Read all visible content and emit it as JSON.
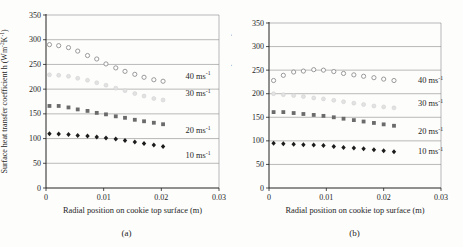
{
  "chart_data": [
    {
      "type": "scatter",
      "caption": "(a)",
      "xlabel": "Radial position on cookie top surface (m)",
      "ylabel_parts": [
        {
          "t": "Surface heat transfer coefficient h (Wm"
        },
        {
          "sup": "-2"
        },
        {
          "t": "K"
        },
        {
          "sup": "-1"
        },
        {
          "t": ")"
        }
      ],
      "xlim": [
        0,
        0.03
      ],
      "ylim": [
        0,
        350
      ],
      "grid": "horizontal",
      "legend_position": "inline-right",
      "xticks": [
        {
          "v": 0,
          "label": "0"
        },
        {
          "v": 0.01,
          "label": "0.01"
        },
        {
          "v": 0.02,
          "label": "0.02"
        },
        {
          "v": 0.03,
          "label": "0.03"
        }
      ],
      "yticks": [
        {
          "v": 0,
          "label": "0"
        },
        {
          "v": 50,
          "label": "50"
        },
        {
          "v": 100,
          "label": "100"
        },
        {
          "v": 150,
          "label": "150"
        },
        {
          "v": 200,
          "label": "200"
        },
        {
          "v": 250,
          "label": "250"
        },
        {
          "v": 300,
          "label": "300"
        },
        {
          "v": 350,
          "label": "350"
        }
      ],
      "x": [
        0.0006,
        0.0022,
        0.0039,
        0.0055,
        0.0072,
        0.0088,
        0.0104,
        0.0121,
        0.0137,
        0.0154,
        0.017,
        0.0187,
        0.0203
      ],
      "series": [
        {
          "name_parts": [
            {
              "t": "40 ms"
            },
            {
              "sup": "-1"
            }
          ],
          "marker": "open-circle",
          "color": "#8f8f8f",
          "label_x": 0.0242,
          "label_y": 227,
          "values": [
            290,
            288,
            284,
            277,
            268,
            261,
            251,
            243,
            236,
            230,
            224,
            219,
            216
          ]
        },
        {
          "name_parts": [
            {
              "t": "30 ms"
            },
            {
              "sup": "-1"
            }
          ],
          "marker": "light-circle",
          "color": "#e2e2e2",
          "label_x": 0.0242,
          "label_y": 191,
          "values": [
            229,
            228,
            226,
            222,
            218,
            213,
            208,
            202,
            197,
            191,
            186,
            181,
            178
          ]
        },
        {
          "name_parts": [
            {
              "t": "20 ms"
            },
            {
              "sup": "-1"
            }
          ],
          "marker": "square",
          "color": "#6b6b6b",
          "label_x": 0.0242,
          "label_y": 116,
          "values": [
            166,
            166,
            163,
            159,
            156,
            152,
            149,
            145,
            142,
            138,
            135,
            132,
            129
          ]
        },
        {
          "name_parts": [
            {
              "t": "10 ms"
            },
            {
              "sup": "-1"
            }
          ],
          "marker": "diamond",
          "color": "#1c1c1c",
          "label_x": 0.0242,
          "label_y": 66,
          "values": [
            110,
            109,
            108,
            106,
            105,
            103,
            101,
            99,
            96,
            93,
            90,
            87,
            84
          ]
        }
      ]
    },
    {
      "type": "scatter",
      "caption": "(b)",
      "xlabel": "Radial position on cookie top surface (m)",
      "ylabel_parts": [
        {
          "t": "Surface heat transfer coefficient h (Wm"
        },
        {
          "sup": "-2"
        },
        {
          "t": "K"
        },
        {
          "sup": "-1"
        },
        {
          "t": ")"
        }
      ],
      "xlim": [
        0,
        0.03
      ],
      "ylim": [
        0,
        350
      ],
      "grid": "horizontal",
      "legend_position": "inline-right",
      "xticks": [
        {
          "v": 0,
          "label": "0"
        },
        {
          "v": 0.01,
          "label": "0.01"
        },
        {
          "v": 0.02,
          "label": "0.02"
        },
        {
          "v": 0.03,
          "label": "0.03"
        }
      ],
      "yticks": [
        {
          "v": 0,
          "label": "0"
        },
        {
          "v": 50,
          "label": "50"
        },
        {
          "v": 100,
          "label": "100"
        },
        {
          "v": 150,
          "label": "150"
        },
        {
          "v": 200,
          "label": "200"
        },
        {
          "v": 250,
          "label": "250"
        },
        {
          "v": 300,
          "label": "300"
        },
        {
          "v": 350,
          "label": "350"
        }
      ],
      "x": [
        0.0008,
        0.0025,
        0.0043,
        0.006,
        0.0078,
        0.0095,
        0.0113,
        0.013,
        0.0148,
        0.0165,
        0.0183,
        0.02,
        0.0218
      ],
      "series": [
        {
          "name_parts": [
            {
              "t": "40 ms"
            },
            {
              "sup": "-1"
            }
          ],
          "marker": "open-circle",
          "color": "#8f8f8f",
          "label_x": 0.026,
          "label_y": 228,
          "values": [
            228,
            239,
            246,
            248,
            251,
            250,
            247,
            243,
            240,
            237,
            234,
            231,
            228
          ]
        },
        {
          "name_parts": [
            {
              "t": "30 ms"
            },
            {
              "sup": "-1"
            }
          ],
          "marker": "light-circle",
          "color": "#e2e2e2",
          "label_x": 0.026,
          "label_y": 180,
          "values": [
            200,
            198,
            196,
            194,
            191,
            189,
            186,
            183,
            180,
            177,
            174,
            172,
            170
          ]
        },
        {
          "name_parts": [
            {
              "t": "20 ms"
            },
            {
              "sup": "-1"
            }
          ],
          "marker": "square",
          "color": "#6b6b6b",
          "label_x": 0.026,
          "label_y": 121,
          "values": [
            161,
            161,
            159,
            157,
            155,
            153,
            150,
            147,
            144,
            141,
            138,
            135,
            132
          ]
        },
        {
          "name_parts": [
            {
              "t": "10 ms"
            },
            {
              "sup": "-1"
            }
          ],
          "marker": "diamond",
          "color": "#1c1c1c",
          "label_x": 0.026,
          "label_y": 78,
          "values": [
            95,
            94,
            93,
            92,
            91,
            90,
            88,
            86,
            85,
            83,
            81,
            79,
            77
          ]
        }
      ]
    }
  ],
  "style": {
    "grid_color": "#8c8c8c",
    "axis_color": "#222222",
    "text_color": "#1f1f1f",
    "background": "#fdfdfc"
  }
}
